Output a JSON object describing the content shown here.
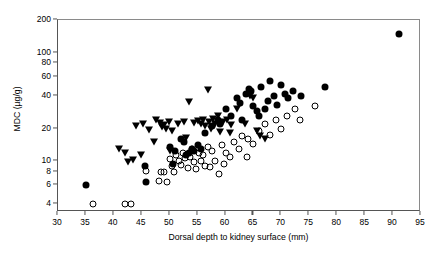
{
  "chart_data": {
    "type": "scatter",
    "title": "",
    "xlabel": "Dorsal depth to kidney surface (mm)",
    "ylabel": "MDC (µg/g)",
    "xlim": [
      30,
      95
    ],
    "ylim": [
      3.4,
      200
    ],
    "yscale": "log",
    "xscale": "linear",
    "grid": false,
    "legend": "none",
    "xticks": [
      30,
      35,
      40,
      45,
      50,
      55,
      60,
      65,
      70,
      75,
      80,
      85,
      90,
      95
    ],
    "xtick_labels": [
      "30",
      "35",
      "40",
      "45",
      "50",
      "55",
      "60",
      "65",
      "70",
      "75",
      "80",
      "85",
      "90",
      "95"
    ],
    "yticks": [
      4,
      6,
      8,
      10,
      20,
      40,
      60,
      80,
      100,
      200
    ],
    "ytick_labels": [
      "4",
      "6",
      "8",
      "10",
      "20",
      "40",
      "60",
      "80",
      "100",
      "200"
    ],
    "series": [
      {
        "name": "filled-triangle-down",
        "marker": "filled-triangle-down",
        "color": "#000000",
        "points": [
          [
            41.0,
            13.0
          ],
          [
            42.0,
            12.0
          ],
          [
            42.6,
            9.8
          ],
          [
            43.4,
            10.2
          ],
          [
            44.0,
            21.0
          ],
          [
            45.2,
            22.0
          ],
          [
            46.3,
            19.5
          ],
          [
            47.2,
            15.0
          ],
          [
            47.6,
            24.0
          ],
          [
            48.2,
            22.5
          ],
          [
            48.6,
            20.5
          ],
          [
            48.9,
            21.5
          ],
          [
            49.4,
            20.0
          ],
          [
            49.8,
            23.0
          ],
          [
            50.4,
            19.0
          ],
          [
            51.4,
            22.0
          ],
          [
            52.6,
            23.0
          ],
          [
            53.4,
            35.0
          ],
          [
            54.3,
            22.5
          ],
          [
            55.0,
            23.5
          ],
          [
            55.6,
            22.0
          ],
          [
            56.0,
            24.0
          ],
          [
            56.4,
            21.0
          ],
          [
            56.8,
            45.0
          ],
          [
            57.0,
            23.0
          ],
          [
            57.4,
            20.0
          ],
          [
            57.8,
            24.5
          ],
          [
            58.2,
            22.0
          ],
          [
            58.6,
            26.0
          ],
          [
            59.0,
            18.5
          ],
          [
            59.6,
            23.0
          ],
          [
            60.2,
            24.0
          ],
          [
            61.0,
            21.5
          ],
          [
            62.0,
            30.0
          ],
          [
            63.4,
            22.0
          ],
          [
            64.4,
            40.0
          ],
          [
            65.0,
            38.0
          ],
          [
            65.6,
            19.0
          ],
          [
            66.2,
            17.0
          ],
          [
            67.0,
            16.0
          ],
          [
            44.8,
            11.5
          ],
          [
            50.0,
            12.5
          ],
          [
            53.0,
            16.5
          ],
          [
            60.8,
            18.0
          ]
        ]
      },
      {
        "name": "filled-circle",
        "marker": "filled-circle",
        "color": "#000000",
        "points": [
          [
            35.0,
            6.0
          ],
          [
            45.6,
            9.0
          ],
          [
            45.8,
            6.4
          ],
          [
            50.0,
            13.5
          ],
          [
            51.0,
            12.5
          ],
          [
            52.0,
            16.0
          ],
          [
            52.6,
            15.0
          ],
          [
            53.0,
            11.5
          ],
          [
            53.4,
            12.0
          ],
          [
            54.0,
            13.0
          ],
          [
            54.4,
            12.5
          ],
          [
            55.0,
            14.0
          ],
          [
            56.4,
            18.0
          ],
          [
            57.6,
            21.0
          ],
          [
            58.6,
            24.0
          ],
          [
            60.0,
            30.0
          ],
          [
            61.0,
            26.0
          ],
          [
            62.0,
            38.0
          ],
          [
            62.6,
            34.0
          ],
          [
            63.0,
            24.0
          ],
          [
            63.6,
            42.0
          ],
          [
            64.2,
            46.0
          ],
          [
            64.6,
            44.0
          ],
          [
            65.0,
            32.0
          ],
          [
            65.6,
            29.0
          ],
          [
            66.4,
            48.0
          ],
          [
            67.0,
            30.0
          ],
          [
            67.6,
            36.0
          ],
          [
            68.0,
            55.0
          ],
          [
            68.6,
            40.0
          ],
          [
            69.2,
            33.0
          ],
          [
            70.0,
            50.0
          ],
          [
            70.6,
            42.0
          ],
          [
            71.2,
            38.0
          ],
          [
            72.0,
            44.0
          ],
          [
            73.6,
            40.0
          ],
          [
            77.8,
            48.0
          ],
          [
            91.0,
            150.0
          ],
          [
            50.6,
            9.5
          ],
          [
            55.6,
            13.0
          ],
          [
            59.0,
            22.0
          ],
          [
            66.0,
            26.0
          ]
        ]
      },
      {
        "name": "open-circle",
        "marker": "open-circle",
        "color": "#000000",
        "points": [
          [
            36.2,
            4.0
          ],
          [
            42.0,
            4.0
          ],
          [
            43.0,
            4.0
          ],
          [
            45.8,
            8.2
          ],
          [
            48.4,
            8.0
          ],
          [
            49.0,
            7.9
          ],
          [
            50.0,
            10.5
          ],
          [
            50.4,
            9.0
          ],
          [
            50.8,
            8.0
          ],
          [
            51.2,
            11.5
          ],
          [
            51.6,
            10.0
          ],
          [
            52.0,
            9.2
          ],
          [
            52.4,
            12.0
          ],
          [
            52.8,
            10.8
          ],
          [
            53.2,
            8.6
          ],
          [
            53.6,
            11.0
          ],
          [
            54.0,
            13.0
          ],
          [
            54.4,
            9.8
          ],
          [
            54.8,
            8.4
          ],
          [
            55.2,
            12.0
          ],
          [
            55.6,
            10.0
          ],
          [
            56.0,
            11.5
          ],
          [
            56.4,
            9.0
          ],
          [
            56.8,
            13.5
          ],
          [
            57.2,
            8.8
          ],
          [
            57.6,
            12.5
          ],
          [
            58.2,
            10.0
          ],
          [
            58.8,
            7.6
          ],
          [
            59.4,
            14.0
          ],
          [
            60.0,
            12.0
          ],
          [
            60.8,
            11.0
          ],
          [
            61.6,
            15.0
          ],
          [
            62.4,
            13.0
          ],
          [
            63.0,
            17.0
          ],
          [
            64.0,
            16.0
          ],
          [
            65.0,
            14.5
          ],
          [
            66.0,
            19.0
          ],
          [
            67.0,
            22.0
          ],
          [
            68.0,
            17.5
          ],
          [
            69.0,
            24.0
          ],
          [
            70.0,
            20.0
          ],
          [
            71.0,
            26.0
          ],
          [
            72.4,
            30.0
          ],
          [
            73.4,
            24.0
          ],
          [
            76.0,
            32.0
          ],
          [
            48.0,
            6.6
          ],
          [
            49.6,
            6.4
          ],
          [
            59.8,
            9.5
          ],
          [
            63.8,
            11.0
          ]
        ]
      }
    ]
  }
}
